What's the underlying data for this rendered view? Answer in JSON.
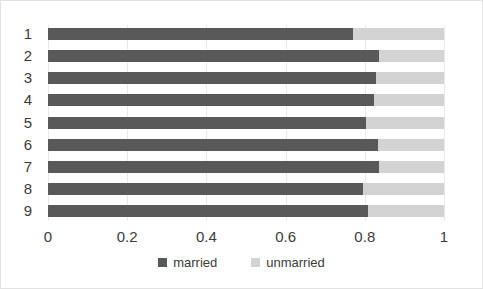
{
  "chart_data": {
    "type": "bar",
    "orientation": "horizontal",
    "stacked": true,
    "title": "",
    "subtitle": "",
    "xlabel": "",
    "ylabel": "",
    "categories": [
      "1",
      "2",
      "3",
      "4",
      "5",
      "6",
      "7",
      "8",
      "9"
    ],
    "series": [
      {
        "name": "married",
        "color": "#595959",
        "values": [
          0.77,
          0.835,
          0.828,
          0.823,
          0.803,
          0.833,
          0.836,
          0.795,
          0.808
        ]
      },
      {
        "name": "unmarried",
        "color": "#d3d3d3",
        "values": [
          0.23,
          0.165,
          0.172,
          0.177,
          0.197,
          0.167,
          0.164,
          0.205,
          0.192
        ]
      }
    ],
    "xlim": [
      0,
      1
    ],
    "xticks": [
      "0",
      "0.2",
      "0.4",
      "0.6",
      "0.8",
      "1"
    ],
    "xtick_values": [
      0,
      0.2,
      0.4,
      0.6,
      0.8,
      1
    ],
    "yticks": [
      "1",
      "2",
      "3",
      "4",
      "5",
      "6",
      "7",
      "8",
      "9"
    ],
    "grid": "vertical",
    "legend_position": "bottom",
    "legend_entries": [
      "married",
      "unmarried"
    ]
  },
  "colors": {
    "married": "#595959",
    "unmarried": "#d3d3d3",
    "gridline": "#e9e9e9",
    "border": "#e2e2e2",
    "text": "#3b3b3b",
    "background": "#ffffff"
  }
}
